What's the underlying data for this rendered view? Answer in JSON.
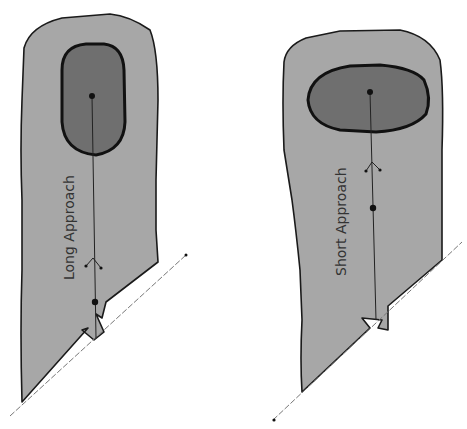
{
  "diagram": {
    "type": "golf hole approach comparison",
    "colors": {
      "fairway": "#a7a7a7",
      "green": "#6f6f6f",
      "outline": "#1a1a1a",
      "background": "#ffffff"
    },
    "holes": [
      {
        "id": "long",
        "label": "Long Approach",
        "green_shape": "tall oval",
        "markers": [
          "pin-dot",
          "landing-chevron",
          "ball-dot",
          "tee-notch"
        ]
      },
      {
        "id": "short",
        "label": "Short Approach",
        "green_shape": "wide oval",
        "markers": [
          "pin-dot",
          "landing-chevron",
          "ball-dot",
          "tee-notch"
        ]
      }
    ]
  }
}
